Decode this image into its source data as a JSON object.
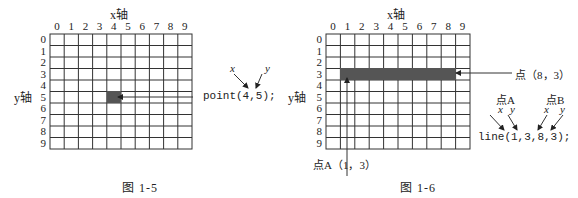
{
  "figure1": {
    "x_axis_label": "x轴",
    "y_axis_label": "y轴",
    "x_ticks": [
      "0",
      "1",
      "2",
      "3",
      "4",
      "5",
      "6",
      "7",
      "8",
      "9"
    ],
    "y_ticks": [
      "0",
      "1",
      "2",
      "3",
      "4",
      "5",
      "6",
      "7",
      "8",
      "9"
    ],
    "point": {
      "x": 4,
      "y": 5
    },
    "code": "point(4,5);",
    "arrow_label_x": "x",
    "arrow_label_y": "y",
    "caption": "图  1-5"
  },
  "figure2": {
    "x_axis_label": "x轴",
    "y_axis_label": "y轴",
    "x_ticks": [
      "0",
      "1",
      "2",
      "3",
      "4",
      "5",
      "6",
      "7",
      "8",
      "9"
    ],
    "y_ticks": [
      "0",
      "1",
      "2",
      "3",
      "4",
      "5",
      "6",
      "7",
      "8",
      "9"
    ],
    "line": {
      "x1": 1,
      "y1": 3,
      "x2": 8,
      "y2": 3
    },
    "point_a_label": "点A（1，3）",
    "point_b_label": "点（8，3）",
    "label_a": "点A",
    "label_b": "点B",
    "arrow_label_x": "x",
    "arrow_label_y": "y",
    "code": "line(1,3,8,3);",
    "caption": "图  1-6"
  },
  "colors": {
    "grid": "#333333",
    "fill": "#555555"
  }
}
